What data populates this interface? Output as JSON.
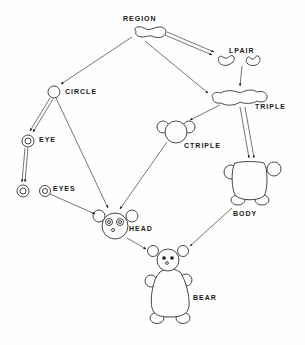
{
  "diagram": {
    "type": "composition-hierarchy",
    "ink_color": "#1a1a1a",
    "background": "#fefefe",
    "nodes": [
      {
        "id": "region",
        "label": "REGION"
      },
      {
        "id": "lpair",
        "label": "LPAIR"
      },
      {
        "id": "triple",
        "label": "TRIPLE"
      },
      {
        "id": "circle",
        "label": "CIRCLE"
      },
      {
        "id": "eye",
        "label": "EYE"
      },
      {
        "id": "eyes",
        "label": "EYES"
      },
      {
        "id": "ctriple",
        "label": "CTRIPLE"
      },
      {
        "id": "body",
        "label": "BODY"
      },
      {
        "id": "head",
        "label": "HEAD"
      },
      {
        "id": "bear",
        "label": "BEAR"
      }
    ],
    "edges": [
      {
        "from": "region",
        "to": "circle",
        "style": "single"
      },
      {
        "from": "region",
        "to": "lpair",
        "style": "double"
      },
      {
        "from": "region",
        "to": "triple",
        "style": "single"
      },
      {
        "from": "lpair",
        "to": "triple",
        "style": "single"
      },
      {
        "from": "triple",
        "to": "ctriple",
        "style": "single"
      },
      {
        "from": "triple",
        "to": "body",
        "style": "double"
      },
      {
        "from": "circle",
        "to": "eye",
        "style": "double"
      },
      {
        "from": "circle",
        "to": "head",
        "style": "single"
      },
      {
        "from": "eye",
        "to": "eyes",
        "style": "double"
      },
      {
        "from": "eyes",
        "to": "head",
        "style": "single"
      },
      {
        "from": "ctriple",
        "to": "head",
        "style": "single"
      },
      {
        "from": "head",
        "to": "bear",
        "style": "single"
      },
      {
        "from": "body",
        "to": "bear",
        "style": "single"
      }
    ]
  }
}
